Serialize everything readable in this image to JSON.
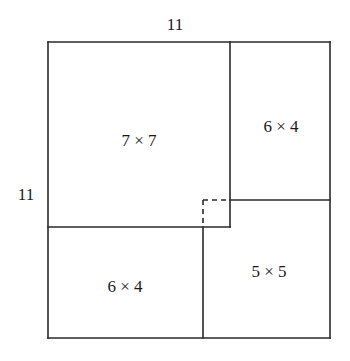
{
  "figure": {
    "type": "square-dissection-diagram",
    "background_color": "#ffffff",
    "line_color": "#2a2a2a",
    "outer_square": {
      "side_label_top": "11",
      "side_label_left": "11",
      "x": 48,
      "y": 42,
      "width": 282,
      "height": 296
    },
    "regions": [
      {
        "name": "top-left-region",
        "label": "7 × 7",
        "center_x": 139,
        "center_y": 140
      },
      {
        "name": "right-region",
        "label": "6 × 4",
        "center_x": 281,
        "center_y": 126
      },
      {
        "name": "bottom-left-region",
        "label": "6 × 4",
        "center_x": 125,
        "center_y": 286
      },
      {
        "name": "bottom-right-region",
        "label": "5 × 5",
        "center_x": 269,
        "center_y": 271
      }
    ],
    "solid_lines": [
      {
        "name": "outer-top-edge",
        "x1": 48,
        "y1": 42,
        "x2": 330,
        "y2": 42
      },
      {
        "name": "outer-right-edge",
        "x1": 330,
        "y1": 42,
        "x2": 330,
        "y2": 338
      },
      {
        "name": "outer-bottom-edge",
        "x1": 48,
        "y1": 338,
        "x2": 330,
        "y2": 338
      },
      {
        "name": "outer-left-edge",
        "x1": 48,
        "y1": 42,
        "x2": 48,
        "y2": 338
      },
      {
        "name": "inner-vertical-upper",
        "x1": 230,
        "y1": 42,
        "x2": 230,
        "y2": 227
      },
      {
        "name": "inner-horizontal-left",
        "x1": 48,
        "y1": 227,
        "x2": 230,
        "y2": 227
      },
      {
        "name": "inner-vertical-lower",
        "x1": 203,
        "y1": 227,
        "x2": 203,
        "y2": 338
      },
      {
        "name": "inner-horizontal-right",
        "x1": 230,
        "y1": 200,
        "x2": 330,
        "y2": 200
      }
    ],
    "dashed_square": {
      "name": "central-hole",
      "x": 203,
      "y": 200,
      "width": 27,
      "height": 27,
      "dashed_edges": [
        "top",
        "left"
      ]
    }
  }
}
